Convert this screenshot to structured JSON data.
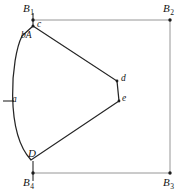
{
  "figure": {
    "width": 186,
    "height": 196,
    "background_color": "#ffffff",
    "frame_color": "#8a8a8a",
    "outline_color": "#252525"
  },
  "corner_labels": {
    "top_left": {
      "base": "B",
      "sub": "1",
      "x": 23,
      "y": 3
    },
    "top_right": {
      "base": "B",
      "sub": "2",
      "x": 163,
      "y": 3
    },
    "bottom_right": {
      "base": "B",
      "sub": "3",
      "x": 163,
      "y": 177
    },
    "bottom_left": {
      "base": "B",
      "sub": "4",
      "x": 23,
      "y": 177
    }
  },
  "point_labels": {
    "c": "c",
    "bA": "bA",
    "a": "a",
    "d": "d",
    "e": "e",
    "D": "D"
  },
  "geometry": {
    "frame": {
      "top_y": 20,
      "bottom_y": 173,
      "left_x": 33,
      "right_x": 170,
      "corner_top_left": [
        33,
        20
      ],
      "corner_top_right": [
        170,
        20
      ],
      "corner_bottom_right": [
        170,
        173
      ],
      "corner_bottom_left": [
        33,
        173
      ]
    },
    "region_vertices": {
      "c": [
        33,
        26
      ],
      "b_A": [
        22,
        36
      ],
      "a": [
        9,
        101
      ],
      "D": [
        31,
        160
      ],
      "e": [
        119,
        101
      ],
      "d": [
        117,
        81
      ]
    },
    "arc_control_points": {
      "upper": [
        10,
        55
      ],
      "lower": [
        6,
        140
      ]
    },
    "ticks": [
      {
        "name": "tick-top-left",
        "x1": 33,
        "y1": 14,
        "x2": 33,
        "y2": 26
      },
      {
        "name": "tick-bottom-left",
        "x1": 33,
        "y1": 160,
        "x2": 33,
        "y2": 180
      },
      {
        "name": "tick-left-a",
        "x1": 3,
        "y1": 101,
        "x2": 15,
        "y2": 101
      }
    ]
  },
  "label_positions": {
    "c": {
      "x": 37,
      "y": 20
    },
    "bA": {
      "x": 21,
      "y": 31
    },
    "a": {
      "x": 12,
      "y": 95
    },
    "d": {
      "x": 121,
      "y": 74
    },
    "e": {
      "x": 122,
      "y": 94
    },
    "D": {
      "x": 28,
      "y": 149
    }
  }
}
